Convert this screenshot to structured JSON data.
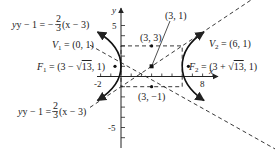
{
  "figure": {
    "type": "hyperbola-graph",
    "equation": "(x-3)^2/9 - (y-1)^2/4 = 1",
    "axes": {
      "x_label": "x",
      "y_label": "y",
      "x_ticks_labeled": [
        "-2",
        "8"
      ],
      "y_ticks_labeled": [
        "5",
        "-5"
      ]
    },
    "points": {
      "center": {
        "label": "(3, 1)",
        "x": 3,
        "y": 1
      },
      "top_mid": {
        "label": "(3, 3)",
        "x": 3,
        "y": 3
      },
      "bottom_mid": {
        "label": "(3, −1)",
        "x": 3,
        "y": -1
      },
      "v1": {
        "name": "V",
        "sub": "1",
        "value": " = (0, 1)",
        "x": 0,
        "y": 1
      },
      "v2": {
        "name": "V",
        "sub": "2",
        "value": " = (6, 1)",
        "x": 6,
        "y": 1
      },
      "f1": {
        "name": "F",
        "sub": "1",
        "value_a": " = (3 − ",
        "sqrt": "13",
        "value_b": ", 1)",
        "x": -0.606,
        "y": 1
      },
      "f2": {
        "name": "F",
        "sub": "2",
        "value_a": " = (3 + ",
        "sqrt": "13",
        "value_b": ", 1)",
        "x": 6.606,
        "y": 1
      }
    },
    "asymptotes": {
      "upper_left": {
        "lhs": "y − 1 = −",
        "num": "2",
        "den": "3",
        "rhs": "(x − 3)"
      },
      "lower_left": {
        "lhs": "y − 1 = ",
        "num": "2",
        "den": "3",
        "rhs": "(x − 3)"
      }
    }
  }
}
